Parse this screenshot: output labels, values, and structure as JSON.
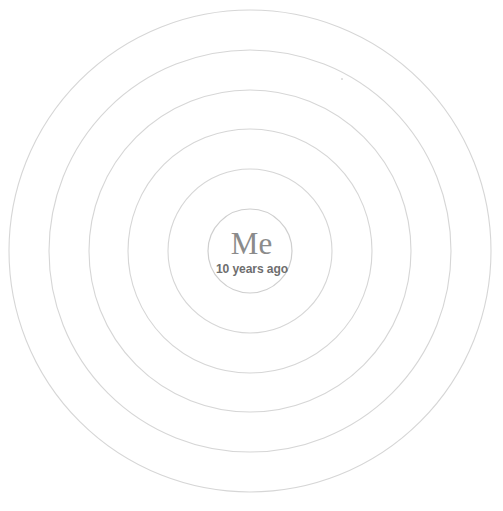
{
  "diagram": {
    "type": "concentric-circles",
    "title_visible": false,
    "background_color": "#ffffff",
    "stroke_color": "#d6d6d6",
    "stroke_color_inner": "#cfcfcf",
    "stroke_width": 1,
    "center_x": 250,
    "center_y": 251,
    "canvas_width": 503,
    "canvas_height": 511,
    "rings": [
      {
        "index": 1,
        "label": "innermost-ring",
        "radius": 42
      },
      {
        "index": 2,
        "label": "ring-2",
        "radius": 82
      },
      {
        "index": 3,
        "label": "ring-3",
        "radius": 122
      },
      {
        "index": 4,
        "label": "ring-4",
        "radius": 161
      },
      {
        "index": 5,
        "label": "ring-5",
        "radius": 201
      },
      {
        "index": 6,
        "label": "outermost-ring",
        "radius": 241
      }
    ],
    "center": {
      "title": "Me",
      "subtitle": "10 years ago",
      "title_color": "#8b8b8b",
      "subtitle_color": "#6e6e6e"
    },
    "artifacts": [
      {
        "name": "speck",
        "x": 341,
        "y": 78
      }
    ]
  }
}
